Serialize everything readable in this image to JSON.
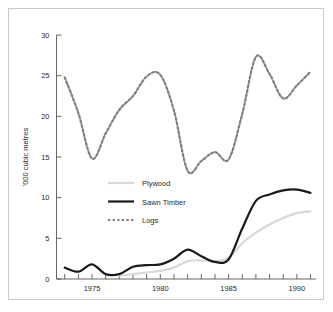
{
  "chart_data": {
    "type": "line",
    "title": "",
    "subtitle": "",
    "xlabel": "",
    "ylabel": "'000 cubic metres",
    "xlim": [
      1972.4,
      1991.4
    ],
    "ylim": [
      0,
      30
    ],
    "grid": false,
    "legend_position": "inside-left-middle",
    "x_tick_labels": [
      "1975",
      "1980",
      "1985",
      "1990"
    ],
    "x_tick_label_values": [
      1975,
      1980,
      1985,
      1990
    ],
    "x_minor_ticks": [
      1973,
      1974,
      1975,
      1976,
      1977,
      1978,
      1979,
      1980,
      1981,
      1982,
      1983,
      1984,
      1985,
      1986,
      1987,
      1988,
      1989,
      1990,
      1991
    ],
    "y_tick_labels": [
      "0",
      "5",
      "10",
      "15",
      "20",
      "25",
      "30"
    ],
    "y_tick_values": [
      0,
      5,
      10,
      15,
      20,
      25,
      30
    ],
    "x": [
      1973,
      1974,
      1975,
      1976,
      1977,
      1978,
      1979,
      1980,
      1981,
      1982,
      1983,
      1984,
      1985,
      1986,
      1987,
      1988,
      1989,
      1990,
      1991
    ],
    "series": [
      {
        "name": "Plywood",
        "style": "solid",
        "color": "#d8d8d8",
        "width": 2.2,
        "values": [
          null,
          null,
          null,
          null,
          0.4,
          0.6,
          0.8,
          1.0,
          1.4,
          2.2,
          2.3,
          2.2,
          2.6,
          4.4,
          5.7,
          6.7,
          7.5,
          8.1,
          8.3
        ]
      },
      {
        "name": "Sawn Timber",
        "style": "solid",
        "color": "#1a1a1a",
        "width": 2.2,
        "values": [
          1.4,
          0.9,
          1.8,
          0.6,
          0.6,
          1.5,
          1.7,
          1.8,
          2.5,
          3.6,
          2.8,
          2.1,
          2.4,
          6.2,
          9.6,
          10.4,
          10.9,
          11.0,
          10.6
        ]
      },
      {
        "name": "Logs",
        "style": "dashed",
        "color": "#808080",
        "width": 2.2,
        "values": [
          24.8,
          20.4,
          14.8,
          17.9,
          20.8,
          22.5,
          24.9,
          25.1,
          20.7,
          13.3,
          14.5,
          15.6,
          14.7,
          20.3,
          27.3,
          25.2,
          22.2,
          23.8,
          25.5
        ]
      }
    ]
  },
  "legend": {
    "items": [
      {
        "label": "Plywood"
      },
      {
        "label": "Sawn Timber"
      },
      {
        "label": "Logs"
      }
    ]
  },
  "colors": {
    "plywood": "#d8d8d8",
    "sawn_timber": "#1a1a1a",
    "logs": "#808080",
    "axis": "#555555",
    "frame": "#c9c9c9",
    "background": "#ffffff"
  }
}
